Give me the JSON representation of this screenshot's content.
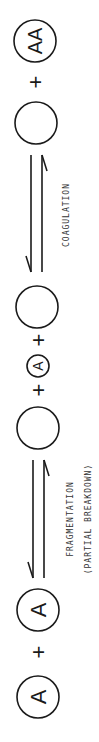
{
  "diagram": {
    "orientation": "rotated 90 degrees counter-clockwise, reads bottom to top",
    "stages": [
      {
        "id": "reactants",
        "items": [
          {
            "type": "particle",
            "label": "A"
          },
          {
            "type": "operator",
            "label": "+"
          },
          {
            "type": "particle",
            "label": "A"
          }
        ]
      },
      {
        "id": "arrow-fragmentation",
        "type": "equilibrium-arrow",
        "label": "FRAGMENTATION",
        "sublabel": "(PARTIAL BREAKDOWN)"
      },
      {
        "id": "intermediates",
        "items": [
          {
            "type": "particle",
            "label": ""
          },
          {
            "type": "operator",
            "label": "+"
          },
          {
            "type": "particle-small",
            "label": "A"
          },
          {
            "type": "operator",
            "label": "+"
          },
          {
            "type": "particle",
            "label": ""
          }
        ]
      },
      {
        "id": "arrow-coagulation",
        "type": "equilibrium-arrow",
        "label": "COAGULATION"
      },
      {
        "id": "products",
        "items": [
          {
            "type": "particle",
            "label": ""
          },
          {
            "type": "operator",
            "label": "+"
          },
          {
            "type": "particle",
            "label": "AA"
          }
        ]
      }
    ],
    "ink_color": "#1a1a1a"
  }
}
